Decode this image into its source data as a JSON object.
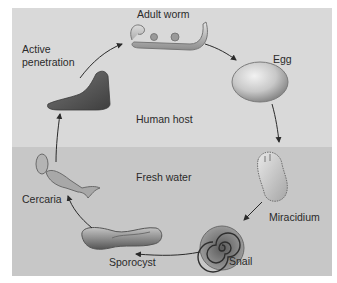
{
  "diagram": {
    "zones": {
      "top": "Human host",
      "bottom": "Fresh water"
    },
    "stages": [
      {
        "id": "adult-worm",
        "label": "Adult worm"
      },
      {
        "id": "egg",
        "label": "Egg"
      },
      {
        "id": "miracidium",
        "label": "Miracidium"
      },
      {
        "id": "snail",
        "label": "Snail"
      },
      {
        "id": "sporocyst",
        "label": "Sporocyst"
      },
      {
        "id": "cercaria",
        "label": "Cercaria"
      },
      {
        "id": "foot",
        "label_line1": "Active",
        "label_line2": "penetration"
      }
    ],
    "colors": {
      "human_host_bg": "#d9d9d9",
      "fresh_water_bg": "#c7c7c7",
      "arrow": "#2a2a2a"
    }
  }
}
